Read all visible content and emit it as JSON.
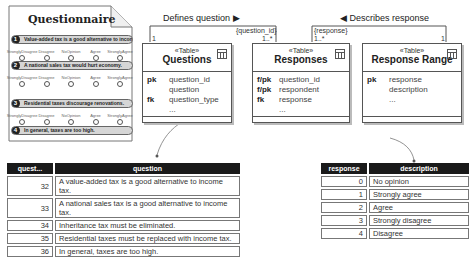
{
  "questionnaire": {
    "title": "Questionnaire",
    "scale_options": [
      {
        "top": "Strongly",
        "bottom": "Disagree"
      },
      {
        "top": "",
        "bottom": "Disagree"
      },
      {
        "top": "No",
        "bottom": "Opinion"
      },
      {
        "top": "",
        "bottom": "Agree"
      },
      {
        "top": "Strongly",
        "bottom": "Agree"
      }
    ],
    "items": [
      {
        "num": "1",
        "text": "Value-added tax is a good alternative to income tax."
      },
      {
        "num": "2",
        "text": "A national sales tax would hurt economy."
      },
      {
        "num": "3",
        "text": "Residential taxes discourage renovations."
      },
      {
        "num": "4",
        "text": "In general, taxes are too high."
      }
    ]
  },
  "associations": {
    "defines": {
      "label": "Defines question ▶",
      "qualifier": "{question_id}",
      "left_mult": "1",
      "right_mult": "1..*"
    },
    "describes": {
      "label": "◀ Describes response",
      "qualifier": "{response}",
      "left_mult": "1..*",
      "right_mult": "1"
    }
  },
  "uml_tables": {
    "questions": {
      "stereotype": "«Table»",
      "name": "Questions",
      "rows": [
        {
          "key": "pk",
          "col": "question_id"
        },
        {
          "key": "",
          "col": "question"
        },
        {
          "key": "fk",
          "col": "question_type"
        },
        {
          "key": "",
          "col": "..."
        }
      ]
    },
    "responses": {
      "stereotype": "«Table»",
      "name": "Responses",
      "rows": [
        {
          "key": "f/pk",
          "col": "question_id"
        },
        {
          "key": "f/pk",
          "col": "respondent"
        },
        {
          "key": "fk",
          "col": "response"
        },
        {
          "key": "",
          "col": "..."
        }
      ]
    },
    "response_range": {
      "stereotype": "«Table»",
      "name": "Response Range",
      "rows": [
        {
          "key": "pk",
          "col": "response"
        },
        {
          "key": "",
          "col": "description"
        },
        {
          "key": "",
          "col": "..."
        }
      ]
    }
  },
  "questions_table": {
    "headers": [
      "quest...",
      "question"
    ],
    "rows": [
      [
        "32",
        "A value-added tax is a good alternative to income tax."
      ],
      [
        "33",
        "A national sales tax is a good alternative to income tax."
      ],
      [
        "34",
        "Inheritance tax must be eliminated."
      ],
      [
        "35",
        "Residential taxes must be replaced with income tax."
      ],
      [
        "36",
        "In general, taxes are too high."
      ]
    ]
  },
  "response_table": {
    "headers": [
      "response",
      "description"
    ],
    "rows": [
      [
        "0",
        "No opinion"
      ],
      [
        "1",
        "Strongly agree"
      ],
      [
        "2",
        "Agree"
      ],
      [
        "3",
        "Strongly disagree"
      ],
      [
        "4",
        "Disagree"
      ]
    ]
  }
}
